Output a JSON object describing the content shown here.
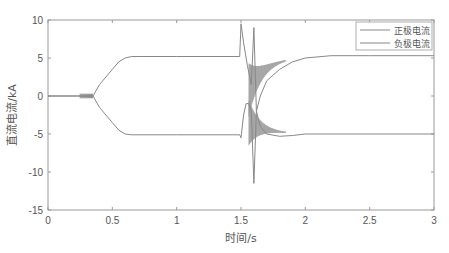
{
  "chart_data": {
    "type": "line",
    "title": "",
    "xlabel": "时间/s",
    "ylabel": "直流电流/kA",
    "xlim": [
      0,
      3
    ],
    "ylim": [
      -15,
      10
    ],
    "x_ticks": [
      "0",
      "0.5",
      "1",
      "1.5",
      "2",
      "2.5",
      "3"
    ],
    "y_ticks": [
      "10",
      "5",
      "0",
      "-5",
      "-10",
      "-15"
    ],
    "grid": false,
    "legend_position": "top-right",
    "series": [
      {
        "name": "正极电流",
        "color": "#888888",
        "x": [
          0,
          0.25,
          0.35,
          0.4,
          0.45,
          0.5,
          0.55,
          0.6,
          0.65,
          0.7,
          1.0,
          1.49,
          1.5,
          1.52,
          1.55,
          1.58,
          1.6,
          1.62,
          1.65,
          1.7,
          1.8,
          1.9,
          2.0,
          2.2,
          2.5,
          3.0
        ],
        "y": [
          0,
          0,
          0,
          1.5,
          2.5,
          3.5,
          4.5,
          5.0,
          5.2,
          5.2,
          5.2,
          5.2,
          9.5,
          7.0,
          4.0,
          1.5,
          9.0,
          -2.0,
          0.0,
          2.0,
          3.5,
          4.5,
          5.0,
          5.3,
          5.3,
          5.3
        ]
      },
      {
        "name": "负极电流",
        "color": "#888888",
        "x": [
          0,
          0.25,
          0.35,
          0.4,
          0.45,
          0.5,
          0.55,
          0.6,
          0.65,
          0.7,
          1.0,
          1.49,
          1.5,
          1.52,
          1.54,
          1.56,
          1.58,
          1.6,
          1.62,
          1.65,
          1.7,
          1.8,
          1.9,
          2.0,
          2.2,
          2.5,
          3.0
        ],
        "y": [
          0,
          0,
          0,
          -1.5,
          -2.5,
          -3.5,
          -4.5,
          -5.0,
          -5.1,
          -5.1,
          -5.1,
          -5.1,
          -5.5,
          -2.5,
          -1.0,
          -1.0,
          -2.0,
          -11.5,
          -2.0,
          -4.0,
          -5.0,
          -5.3,
          -5.2,
          -5.0,
          -5.0,
          -5.0,
          -5.0
        ]
      }
    ],
    "annotations": [
      "small oscillation near 0 between t=0.25 and 0.35 s",
      "fault transient with heavy oscillation between t=1.5 and 1.8 s"
    ]
  },
  "legend": {
    "items": [
      "正极电流",
      "负极电流"
    ]
  }
}
